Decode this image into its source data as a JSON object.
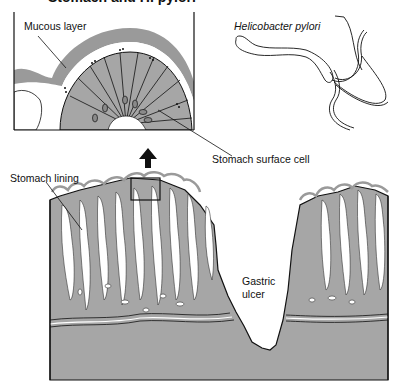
{
  "figure": {
    "title_partial": "Stomach and H. pylori",
    "labels": {
      "mucous_layer": "Mucous layer",
      "helicobacter": "Helicobacter pylori",
      "surface_cell": "Stomach surface cell",
      "stomach_lining": "Stomach lining",
      "gastric_ulcer_line1": "Gastric",
      "gastric_ulcer_line2": "ulcer"
    },
    "colors": {
      "tissue": "#a6a6a6",
      "mucus": "#9a9a9a",
      "outline": "#111111",
      "background": "#ffffff"
    }
  }
}
